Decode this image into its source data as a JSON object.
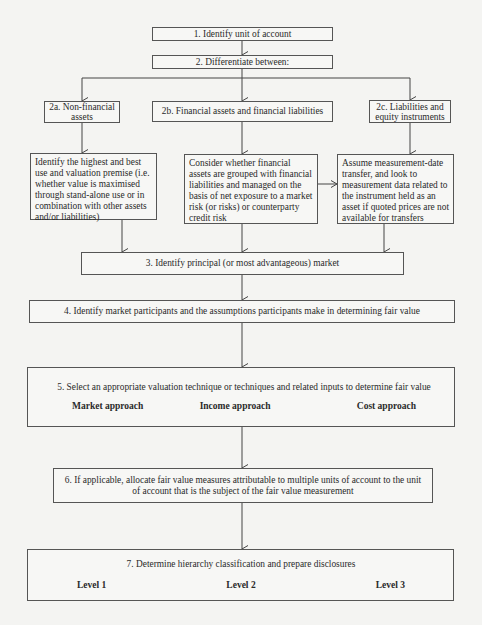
{
  "diagram": {
    "steps": {
      "step1": "1. Identify unit of account",
      "step2": "2. Differentiate between:",
      "step2a": "2a. Non-financial assets",
      "step2b": "2b. Financial assets and financial liabilities",
      "step2c": "2c. Liabilities and equity instruments",
      "step2a_detail": "Identify the highest and best use and valuation premise (i.e. whether value is maximised through stand-alone use or in combination with other assets and/or liabilities)",
      "step2b_detail": "Consider whether financial assets are grouped with financial liabilities and managed on the basis of net exposure to a market risk (or risks) or counterparty credit risk",
      "step2c_detail": "Assume measurement-date transfer, and look to measurement data related to the instrument held as an asset if quoted prices are not available for transfers",
      "step3": "3. Identify principal (or most advantageous) market",
      "step4": "4. Identify market participants and the assumptions participants make in determining fair value",
      "step5": "5. Select an appropriate valuation technique or techniques and related inputs to determine fair value",
      "step5_options": [
        "Market approach",
        "Income approach",
        "Cost approach"
      ],
      "step6": "6. If applicable, allocate fair value measures attributable to multiple units of account to the unit of account that is the subject of the fair value measurement",
      "step7": "7. Determine hierarchy classification and prepare disclosures",
      "step7_options": [
        "Level 1",
        "Level 2",
        "Level 3"
      ]
    },
    "colors": {
      "line": "#444444",
      "box_border": "#555555",
      "background": "#f4f4f2"
    }
  }
}
